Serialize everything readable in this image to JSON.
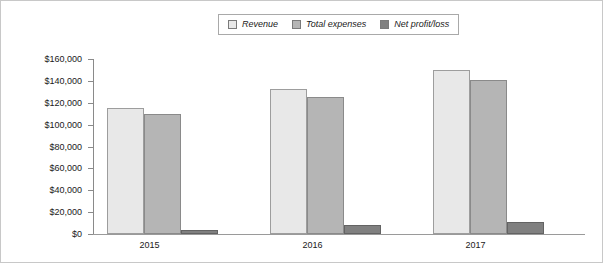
{
  "chart_data": {
    "type": "bar",
    "title": "",
    "xlabel": "",
    "ylabel": "",
    "categories": [
      "2015",
      "2016",
      "2017"
    ],
    "series": [
      {
        "name": "Revenue",
        "values": [
          115000,
          133000,
          150000
        ],
        "color": "#e8e8e8"
      },
      {
        "name": "Total expenses",
        "values": [
          110000,
          125000,
          141000
        ],
        "color": "#b5b5b5"
      },
      {
        "name": "Net profit/loss",
        "values": [
          4000,
          8000,
          11000
        ],
        "color": "#808080"
      }
    ],
    "ylim": [
      0,
      160000
    ],
    "ytick_step": 20000,
    "ytick_labels": [
      "$0",
      "$20,000",
      "$40,000",
      "$60,000",
      "$80,000",
      "$100,000",
      "$120,000",
      "$140,000",
      "$160,000"
    ],
    "grid": false,
    "legend_position": "top-center"
  }
}
